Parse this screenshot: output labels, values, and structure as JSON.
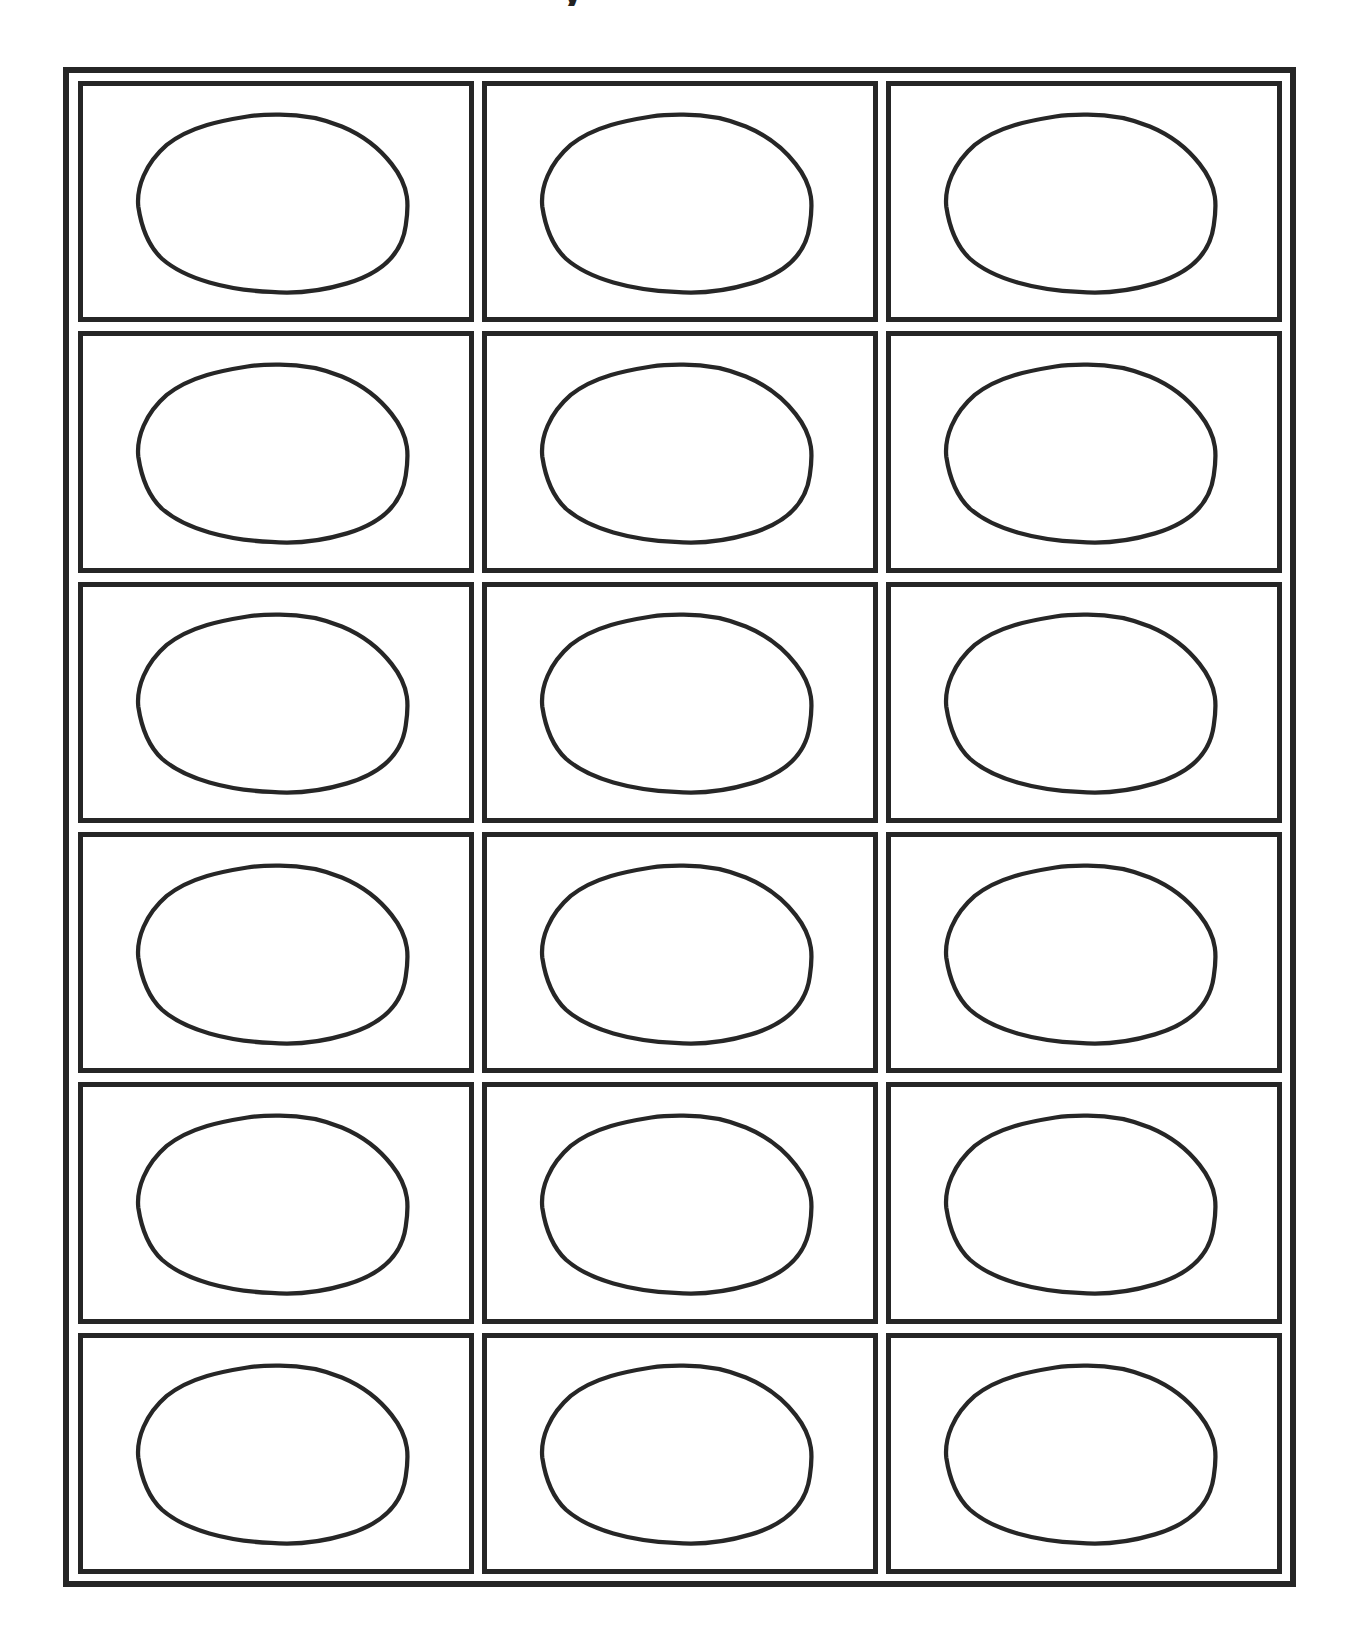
{
  "page": {
    "title_fragment": "y",
    "layout": {
      "columns": 3,
      "rows": 6,
      "frame": "double-line border",
      "stroke_color": "#262626",
      "background": "#ffffff"
    },
    "cells": [
      {
        "row": 1,
        "col": 1,
        "shape": "oval",
        "content": ""
      },
      {
        "row": 1,
        "col": 2,
        "shape": "oval",
        "content": ""
      },
      {
        "row": 1,
        "col": 3,
        "shape": "oval",
        "content": ""
      },
      {
        "row": 2,
        "col": 1,
        "shape": "oval",
        "content": ""
      },
      {
        "row": 2,
        "col": 2,
        "shape": "oval",
        "content": ""
      },
      {
        "row": 2,
        "col": 3,
        "shape": "oval",
        "content": ""
      },
      {
        "row": 3,
        "col": 1,
        "shape": "oval",
        "content": ""
      },
      {
        "row": 3,
        "col": 2,
        "shape": "oval",
        "content": ""
      },
      {
        "row": 3,
        "col": 3,
        "shape": "oval",
        "content": ""
      },
      {
        "row": 4,
        "col": 1,
        "shape": "oval",
        "content": ""
      },
      {
        "row": 4,
        "col": 2,
        "shape": "oval",
        "content": ""
      },
      {
        "row": 4,
        "col": 3,
        "shape": "oval",
        "content": ""
      },
      {
        "row": 5,
        "col": 1,
        "shape": "oval",
        "content": ""
      },
      {
        "row": 5,
        "col": 2,
        "shape": "oval",
        "content": ""
      },
      {
        "row": 5,
        "col": 3,
        "shape": "oval",
        "content": ""
      },
      {
        "row": 6,
        "col": 1,
        "shape": "oval",
        "content": ""
      },
      {
        "row": 6,
        "col": 2,
        "shape": "oval",
        "content": ""
      },
      {
        "row": 6,
        "col": 3,
        "shape": "oval",
        "content": ""
      }
    ]
  }
}
